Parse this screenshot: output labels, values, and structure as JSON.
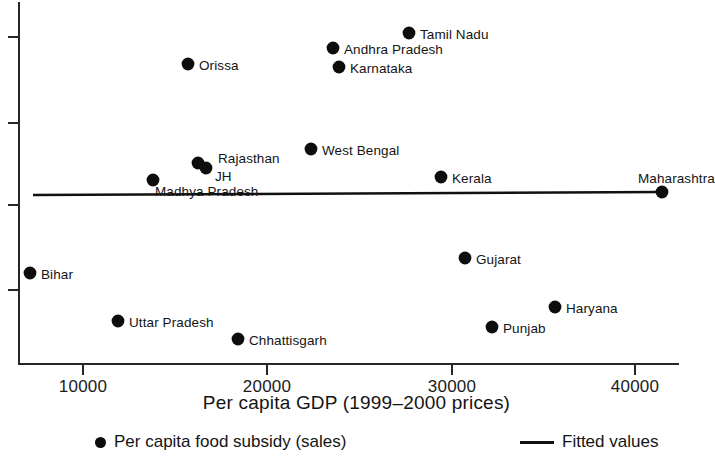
{
  "chart_data": {
    "type": "scatter",
    "title": "",
    "xlabel": "Per capita GDP (1999–2000 prices)",
    "ylabel": "",
    "xlim": [
      5200,
      44500
    ],
    "ylim": [
      0,
      1
    ],
    "grid": false,
    "legend_position": "bottom",
    "xticks": [
      10000,
      20000,
      30000,
      40000
    ],
    "xtick_labels": [
      "10000",
      "20000",
      "30000",
      "40000"
    ],
    "ytick_labels": [
      "",
      "",
      "",
      ""
    ],
    "series": [
      {
        "name": "Per capita food subsidy (sales)",
        "type": "scatter",
        "marker": "circle",
        "color": "#0d0d0d",
        "points": [
          {
            "label": "Tamil Nadu",
            "x": 27700,
            "y": 0.905,
            "px": 409,
            "py": 33,
            "label_dx": 11,
            "label_dy": -5
          },
          {
            "label": "Andhra Pradesh",
            "x": 23650,
            "y": 0.862,
            "px": 333,
            "py": 48,
            "label_dx": 11,
            "label_dy": -5
          },
          {
            "label": "Orissa",
            "x": 15750,
            "y": 0.818,
            "px": 188,
            "py": 64,
            "label_dx": 11,
            "label_dy": -5
          },
          {
            "label": "Karnataka",
            "x": 24200,
            "y": 0.809,
            "px": 339,
            "py": 67,
            "label_dx": 11,
            "label_dy": -5
          },
          {
            "label": "West Bengal",
            "x": 22400,
            "y": 0.672,
            "px": 311,
            "py": 149,
            "label_dx": 11,
            "label_dy": -5
          },
          {
            "label": "Rajasthan",
            "x": 16800,
            "y": 0.645,
            "px": 198,
            "py": 163,
            "label_dx": 20,
            "label_dy": -11
          },
          {
            "label": "JH",
            "x": 17200,
            "y": 0.632,
            "px": 206,
            "py": 168,
            "label_dx": 9,
            "label_dy": 2
          },
          {
            "label": "Madhya Pradesh",
            "x": 13650,
            "y": 0.612,
            "px": 153,
            "py": 180,
            "label_dx": 2,
            "label_dy": 5
          },
          {
            "label": "Kerala",
            "x": 29600,
            "y": 0.62,
            "px": 441,
            "py": 177,
            "label_dx": 11,
            "label_dy": -5
          },
          {
            "label": "Maharashtra",
            "x": 41600,
            "y": 0.593,
            "px": 662,
            "py": 192,
            "label_dx": -24,
            "label_dy": -20
          },
          {
            "label": "Gujarat",
            "x": 30700,
            "y": 0.452,
            "px": 465,
            "py": 258,
            "label_dx": 11,
            "label_dy": -5
          },
          {
            "label": "Bihar",
            "x": 7150,
            "y": 0.425,
            "px": 30,
            "py": 273,
            "label_dx": 11,
            "label_dy": -5
          },
          {
            "label": "Haryana",
            "x": 35600,
            "y": 0.334,
            "px": 555,
            "py": 307,
            "label_dx": 11,
            "label_dy": -5
          },
          {
            "label": "Uttar Pradesh",
            "x": 12000,
            "y": 0.302,
            "px": 118,
            "py": 321,
            "label_dx": 11,
            "label_dy": -5
          },
          {
            "label": "Punjab",
            "x": 32300,
            "y": 0.291,
            "px": 492,
            "py": 327,
            "label_dx": 11,
            "label_dy": -5
          },
          {
            "label": "Chhattisgarh",
            "x": 18700,
            "y": 0.264,
            "px": 238,
            "py": 339,
            "label_dx": 11,
            "label_dy": -5
          }
        ]
      },
      {
        "name": "Fitted values",
        "type": "line",
        "color": "#111111",
        "x_start": 6000,
        "x_end": 41600,
        "y_start": 0.588,
        "y_end": 0.593,
        "px_start": 33,
        "py_start": 195,
        "px_end": 662,
        "py_end": 192
      }
    ]
  },
  "axes": {
    "x_tick_labels": [
      {
        "text": "10000",
        "px": 83
      },
      {
        "text": "20000",
        "px": 267
      },
      {
        "text": "30000",
        "px": 452
      },
      {
        "text": "40000",
        "px": 635
      }
    ],
    "x_title": "Per capita GDP (1999–2000 prices)"
  },
  "legend": {
    "points_label": "Per capita food subsidy (sales)",
    "fit_label": "Fitted values",
    "point_marker": "filled-circle-icon",
    "line_marker": "solid-line-icon"
  },
  "colors": {
    "marker": "#0d0d0d",
    "fit_line": "#111111",
    "axis": "#262626",
    "background": "#ffffff",
    "text": "#141414"
  }
}
